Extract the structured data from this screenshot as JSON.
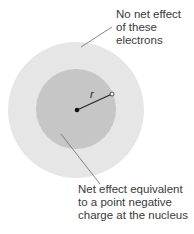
{
  "diagram": {
    "colors": {
      "outer_shell": "#e6e6e6",
      "inner_sphere": "#c6c6c6",
      "nucleus": "#111111",
      "leader_line": "#6a6a6a",
      "text": "#3a3a3a"
    },
    "outer_label": {
      "lines": [
        "No net effect",
        "of these",
        "electrons"
      ]
    },
    "inner_label": {
      "lines": [
        "Net effect equivalent",
        "to a point negative",
        "charge at the nucleus"
      ]
    },
    "radius_label": "r",
    "nodes": [
      {
        "id": "nucleus",
        "kind": "filled-point"
      },
      {
        "id": "test-point",
        "kind": "hollow-point"
      }
    ]
  }
}
